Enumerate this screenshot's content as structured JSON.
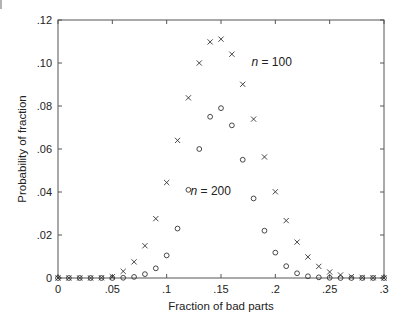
{
  "chart_data": {
    "type": "scatter",
    "title": "",
    "xlabel": "Fraction of bad parts",
    "ylabel": "Probability of fraction",
    "xlim": [
      0,
      0.3
    ],
    "ylim": [
      0,
      0.12
    ],
    "grid": false,
    "legend": "none (inline annotations)",
    "x_ticks": [
      0,
      0.05,
      0.1,
      0.15,
      0.2,
      0.25,
      0.3
    ],
    "x_tick_labels": [
      "0",
      ".05",
      ".1",
      ".15",
      ".2",
      ".25",
      ".3"
    ],
    "y_ticks": [
      0,
      0.02,
      0.04,
      0.06,
      0.08,
      0.1,
      0.12
    ],
    "y_tick_labels": [
      "0",
      ".02",
      ".04",
      ".06",
      ".08",
      ".10",
      ".12"
    ],
    "x": [
      0.0,
      0.01,
      0.02,
      0.03,
      0.04,
      0.05,
      0.06,
      0.07,
      0.08,
      0.09,
      0.1,
      0.11,
      0.12,
      0.13,
      0.14,
      0.15,
      0.16,
      0.17,
      0.18,
      0.19,
      0.2,
      0.21,
      0.22,
      0.23,
      0.24,
      0.25,
      0.26,
      0.27,
      0.28,
      0.29,
      0.3
    ],
    "series": [
      {
        "name": "n = 100",
        "marker": "x",
        "values": [
          0.0,
          0.0,
          0.0,
          0.0,
          0.0001,
          0.0006,
          0.0031,
          0.0075,
          0.015,
          0.0276,
          0.0444,
          0.064,
          0.0838,
          0.1,
          0.1098,
          0.1111,
          0.1041,
          0.0901,
          0.0739,
          0.0563,
          0.0401,
          0.0267,
          0.0167,
          0.0098,
          0.0054,
          0.0028,
          0.0014,
          0.0006,
          0.0002,
          0.0001,
          0.0
        ]
      },
      {
        "name": "n = 200",
        "marker": "o",
        "values": [
          0.0,
          0.0,
          0.0,
          0.0,
          0.0,
          0.0,
          0.0001,
          0.0005,
          0.0018,
          0.0045,
          0.0105,
          0.023,
          0.041,
          0.06,
          0.075,
          0.079,
          0.071,
          0.055,
          0.037,
          0.022,
          0.0118,
          0.0055,
          0.0022,
          0.0008,
          0.0003,
          0.0001,
          0.0,
          0.0,
          0.0,
          0.0,
          0.0
        ]
      }
    ],
    "annotations": [
      {
        "text_italic": "n",
        "text_rest": " = 100",
        "x": 0.178,
        "y": 0.0985
      },
      {
        "text_italic": "n",
        "text_rest": " = 200",
        "x": 0.122,
        "y": 0.0385
      }
    ]
  }
}
